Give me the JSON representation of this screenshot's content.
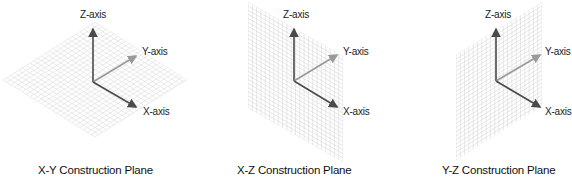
{
  "figure": {
    "panels": [
      {
        "id": "xy",
        "caption": "X-Y Construction Plane",
        "plane": "X-Y",
        "axes": {
          "z": "Z-axis",
          "y": "Y-axis",
          "x": "X-axis"
        }
      },
      {
        "id": "xz",
        "caption": "X-Z Construction Plane",
        "plane": "X-Z",
        "axes": {
          "z": "Z-axis",
          "y": "Y-axis",
          "x": "X-axis"
        }
      },
      {
        "id": "yz",
        "caption": "Y-Z Construction Plane",
        "plane": "Y-Z",
        "axes": {
          "z": "Z-axis",
          "y": "Y-axis",
          "x": "X-axis"
        }
      }
    ],
    "colors": {
      "axis_dark": "#4a4a4a",
      "axis_light": "#9a9a9a",
      "grid": "#d9d9d9",
      "text": "#222222"
    }
  }
}
